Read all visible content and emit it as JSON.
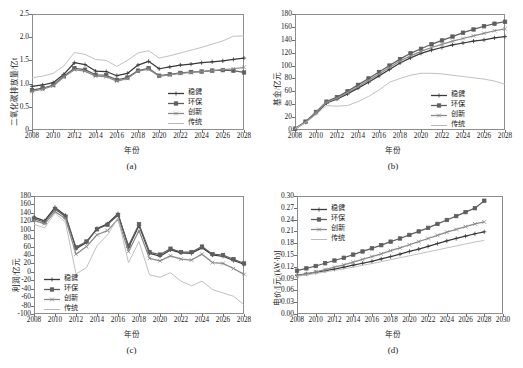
{
  "figure": {
    "panels": [
      {
        "id": "a",
        "caption": "(a)",
        "ylabel": "二氧化碳排放量/亿t",
        "xlabel": "年份"
      },
      {
        "id": "b",
        "caption": "(b)",
        "ylabel": "基金/亿元",
        "xlabel": "年份"
      },
      {
        "id": "c",
        "caption": "(c)",
        "ylabel": "利润/亿元",
        "xlabel": "年份"
      },
      {
        "id": "d",
        "caption": "(d)",
        "ylabel": "电价/[元/(kW·h)]",
        "xlabel": "年份"
      }
    ]
  },
  "legend_labels": {
    "wenjian": "稳健",
    "huanbao": "环保",
    "chuangxin": "创新",
    "chuantong": "传统"
  },
  "colors": {
    "wenjian": "#3a3a3a",
    "huanbao": "#5e5e5e",
    "chuangxin": "#8a8a8a",
    "chuantong": "#b9b9b9",
    "axis": "#8d8d8d",
    "text": "#1a1a1a",
    "background": "#ffffff"
  },
  "chart_data": [
    {
      "type": "line",
      "panel": "a",
      "title": "",
      "xlabel": "年份",
      "ylabel": "二氧化碳排放量/亿t",
      "xlim": [
        2008,
        2028
      ],
      "ylim": [
        0,
        2.5
      ],
      "yticks": [
        0,
        0.5,
        1.0,
        1.5,
        2.0,
        2.5
      ],
      "ytick_labels": [
        "0",
        "0.5",
        "1.0",
        "1.5",
        "2.0",
        "2.5"
      ],
      "xticks": [
        2008,
        2010,
        2012,
        2014,
        2016,
        2018,
        2020,
        2022,
        2024,
        2026,
        2028
      ],
      "grid": false,
      "legend_position": "right-middle",
      "x": [
        2008,
        2009,
        2010,
        2011,
        2012,
        2013,
        2014,
        2015,
        2016,
        2017,
        2018,
        2019,
        2020,
        2021,
        2022,
        2023,
        2024,
        2025,
        2026,
        2027,
        2028
      ],
      "series": [
        {
          "name": "稳健",
          "marker": "plus",
          "values": [
            0.94,
            0.97,
            1.02,
            1.2,
            1.45,
            1.41,
            1.27,
            1.26,
            1.17,
            1.22,
            1.4,
            1.48,
            1.32,
            1.36,
            1.4,
            1.42,
            1.45,
            1.47,
            1.49,
            1.52,
            1.55
          ]
        },
        {
          "name": "环保",
          "marker": "square",
          "values": [
            0.86,
            0.9,
            0.97,
            1.16,
            1.33,
            1.3,
            1.19,
            1.18,
            1.08,
            1.13,
            1.28,
            1.33,
            1.17,
            1.2,
            1.23,
            1.25,
            1.26,
            1.28,
            1.29,
            1.28,
            1.24
          ]
        },
        {
          "name": "创新",
          "marker": "cross",
          "values": [
            0.83,
            0.88,
            0.95,
            1.14,
            1.3,
            1.27,
            1.16,
            1.15,
            1.05,
            1.11,
            1.27,
            1.31,
            1.16,
            1.19,
            1.22,
            1.24,
            1.26,
            1.28,
            1.3,
            1.32,
            1.35
          ]
        },
        {
          "name": "传统",
          "marker": "line",
          "values": [
            1.13,
            1.16,
            1.22,
            1.38,
            1.67,
            1.63,
            1.52,
            1.5,
            1.37,
            1.5,
            1.66,
            1.71,
            1.55,
            1.6,
            1.66,
            1.72,
            1.78,
            1.85,
            1.92,
            2.02,
            2.03
          ]
        }
      ]
    },
    {
      "type": "line",
      "panel": "b",
      "title": "",
      "xlabel": "年份",
      "ylabel": "基金/亿元",
      "xlim": [
        2008,
        2028
      ],
      "ylim": [
        0,
        180
      ],
      "yticks": [
        0,
        20,
        40,
        60,
        80,
        100,
        120,
        140,
        160,
        180
      ],
      "ytick_labels": [
        "0",
        "20",
        "40",
        "60",
        "80",
        "100",
        "120",
        "140",
        "160",
        "180"
      ],
      "xticks": [
        2008,
        2010,
        2012,
        2014,
        2016,
        2018,
        2020,
        2022,
        2024,
        2026,
        2028
      ],
      "grid": false,
      "legend_position": "right-lower",
      "x": [
        2008,
        2009,
        2010,
        2011,
        2012,
        2013,
        2014,
        2015,
        2016,
        2017,
        2018,
        2019,
        2020,
        2021,
        2022,
        2023,
        2024,
        2025,
        2026,
        2027,
        2028
      ],
      "series": [
        {
          "name": "稳健",
          "marker": "plus",
          "values": [
            2,
            12,
            26,
            42,
            48,
            56,
            65,
            74,
            84,
            94,
            104,
            112,
            119,
            124,
            128,
            132,
            135,
            138,
            140,
            143,
            145
          ]
        },
        {
          "name": "环保",
          "marker": "square",
          "values": [
            2,
            13,
            28,
            44,
            51,
            60,
            70,
            80,
            90,
            100,
            110,
            119,
            126,
            133,
            139,
            145,
            151,
            156,
            161,
            165,
            168
          ]
        },
        {
          "name": "创新",
          "marker": "cross",
          "values": [
            2,
            12,
            27,
            43,
            49,
            58,
            67,
            77,
            87,
            97,
            107,
            115,
            122,
            128,
            133,
            138,
            142,
            146,
            150,
            154,
            157
          ]
        },
        {
          "name": "传统",
          "marker": "line",
          "values": [
            2,
            11,
            24,
            38,
            37,
            38,
            44,
            52,
            62,
            74,
            80,
            85,
            88,
            88,
            87,
            85,
            83,
            81,
            79,
            76,
            71
          ]
        }
      ]
    },
    {
      "type": "line",
      "panel": "c",
      "title": "",
      "xlabel": "年份",
      "ylabel": "利润/亿元",
      "xlim": [
        2008,
        2028
      ],
      "ylim": [
        -100,
        180
      ],
      "yticks": [
        -100,
        -80,
        -60,
        -40,
        -20,
        0,
        20,
        40,
        60,
        80,
        100,
        120,
        140,
        160,
        180
      ],
      "ytick_labels": [
        "-100",
        "-80",
        "-60",
        "-40",
        "-20",
        "0",
        "20",
        "40",
        "60",
        "80",
        "100",
        "120",
        "140",
        "160",
        "180"
      ],
      "xticks": [
        2008,
        2010,
        2012,
        2014,
        2016,
        2018,
        2020,
        2022,
        2024,
        2026,
        2028
      ],
      "grid": false,
      "legend_position": "left-lower",
      "x": [
        2008,
        2009,
        2010,
        2011,
        2012,
        2013,
        2014,
        2015,
        2016,
        2017,
        2018,
        2019,
        2020,
        2021,
        2022,
        2023,
        2024,
        2025,
        2026,
        2027,
        2028
      ],
      "series": [
        {
          "name": "稳健",
          "marker": "plus",
          "values": [
            130,
            121,
            153,
            134,
            55,
            70,
            103,
            114,
            138,
            58,
            110,
            44,
            37,
            52,
            45,
            44,
            57,
            40,
            37,
            27,
            18
          ]
        },
        {
          "name": "环保",
          "marker": "square",
          "values": [
            126,
            118,
            149,
            131,
            58,
            72,
            101,
            112,
            135,
            62,
            113,
            47,
            41,
            55,
            47,
            47,
            60,
            42,
            40,
            30,
            20
          ]
        },
        {
          "name": "创新",
          "marker": "cross",
          "values": [
            122,
            114,
            143,
            126,
            42,
            60,
            88,
            98,
            125,
            48,
            98,
            32,
            26,
            38,
            30,
            28,
            42,
            22,
            20,
            8,
            -6
          ]
        },
        {
          "name": "传统",
          "marker": "line",
          "values": [
            113,
            104,
            140,
            117,
            -5,
            10,
            62,
            88,
            128,
            22,
            72,
            -7,
            -13,
            -2,
            -22,
            -33,
            -22,
            -42,
            -50,
            -58,
            -78
          ]
        }
      ]
    },
    {
      "type": "line",
      "panel": "d",
      "title": "",
      "xlabel": "年份",
      "ylabel": "电价/[元/(kW·h)]",
      "xlim": [
        2008,
        2030
      ],
      "ylim": [
        0,
        0.3
      ],
      "yticks": [
        0,
        0.03,
        0.06,
        0.09,
        0.12,
        0.15,
        0.18,
        0.21,
        0.24,
        0.27,
        0.3
      ],
      "ytick_labels": [
        "0.00",
        "0.03",
        "0.06",
        "0.09",
        "0.12",
        "0.15",
        "0.18",
        "0.21",
        "0.24",
        "0.27",
        "0.30"
      ],
      "xticks": [
        2008,
        2010,
        2012,
        2014,
        2016,
        2018,
        2020,
        2022,
        2024,
        2026,
        2028,
        2030
      ],
      "grid": false,
      "legend_position": "left-upper",
      "x": [
        2008,
        2009,
        2010,
        2011,
        2012,
        2013,
        2014,
        2015,
        2016,
        2017,
        2018,
        2019,
        2020,
        2021,
        2022,
        2023,
        2024,
        2025,
        2026,
        2027,
        2028
      ],
      "series": [
        {
          "name": "稳健",
          "marker": "plus",
          "values": [
            0.098,
            0.102,
            0.106,
            0.11,
            0.114,
            0.119,
            0.124,
            0.129,
            0.134,
            0.14,
            0.146,
            0.152,
            0.159,
            0.165,
            0.172,
            0.179,
            0.186,
            0.192,
            0.198,
            0.204,
            0.209
          ]
        },
        {
          "name": "环保",
          "marker": "square",
          "values": [
            0.11,
            0.116,
            0.122,
            0.129,
            0.136,
            0.143,
            0.151,
            0.159,
            0.167,
            0.175,
            0.184,
            0.192,
            0.201,
            0.21,
            0.219,
            0.229,
            0.239,
            0.249,
            0.259,
            0.269,
            0.288
          ]
        },
        {
          "name": "创新",
          "marker": "cross",
          "values": [
            0.097,
            0.102,
            0.107,
            0.113,
            0.119,
            0.125,
            0.132,
            0.139,
            0.146,
            0.153,
            0.161,
            0.168,
            0.176,
            0.184,
            0.192,
            0.2,
            0.208,
            0.215,
            0.222,
            0.229,
            0.234
          ]
        },
        {
          "name": "传统",
          "marker": "line",
          "values": [
            0.096,
            0.099,
            0.103,
            0.107,
            0.111,
            0.115,
            0.119,
            0.124,
            0.128,
            0.133,
            0.138,
            0.143,
            0.148,
            0.153,
            0.158,
            0.163,
            0.168,
            0.173,
            0.178,
            0.183,
            0.187
          ]
        }
      ]
    }
  ]
}
